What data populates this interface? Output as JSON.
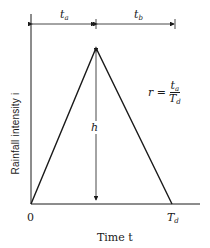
{
  "diagram": {
    "type": "triangular hyetograph",
    "y_axis_label": "Rainfall intensity i",
    "x_axis_label": "Time t",
    "origin_label": "0",
    "end_label": {
      "main": "T",
      "sub": "d"
    },
    "peak_label": "h",
    "dimensions": {
      "rising": {
        "main": "t",
        "sub": "a"
      },
      "falling": {
        "main": "t",
        "sub": "b"
      }
    },
    "ratio": {
      "lhs": "r =",
      "numerator": {
        "main": "t",
        "sub": "a"
      },
      "denominator": {
        "main": "T",
        "sub": "d"
      }
    }
  }
}
